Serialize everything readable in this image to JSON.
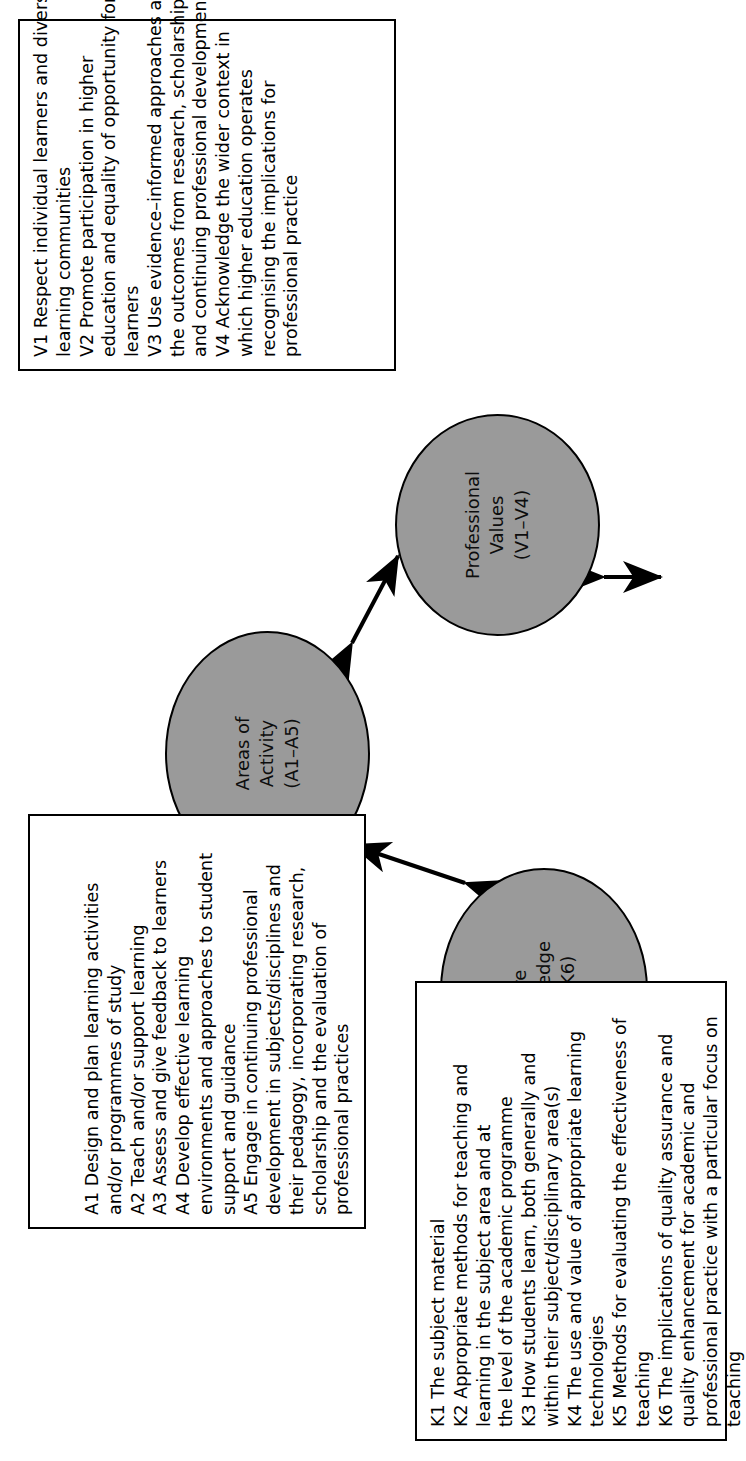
{
  "diagram": {
    "orientation": "rotated-90-ccw",
    "fill_color": "#9a9a9a",
    "stroke_color": "#000000",
    "background_color": "#ffffff"
  },
  "nodes": {
    "areas": {
      "label_lines": [
        "Areas of",
        "Activity",
        "(A1–A5)"
      ],
      "label_text": "Areas of Activity (A1–A5)"
    },
    "values": {
      "label_lines": [
        "Professional",
        "Values",
        "(V1–V4)"
      ],
      "label_text": "Professional Values (V1–V4)"
    },
    "knowledge": {
      "label_lines": [
        "Core",
        "Knowledge",
        "(K1–K6)"
      ],
      "label_text": "Core Knowledge (K1–K6)"
    }
  },
  "boxes": {
    "areas_of_activity": {
      "lines": [
        "A1 Design and plan learning activities",
        "and/or programmes of study",
        "A2 Teach and/or support learning",
        "A3 Assess and give feedback to learners",
        "A4 Develop effective learning",
        "environments and approaches to student",
        "support and guidance",
        "A5 Engage in continuing professional",
        "development in subjects/disciplines and",
        "their pedagogy, incorporating research,",
        "scholarship and the evaluation of",
        "professional practices"
      ]
    },
    "professional_values": {
      "lines": [
        "V1 Respect individual learners and diverse",
        "learning communities",
        "V2 Promote participation in higher",
        "education and equality of opportunity for",
        "learners",
        "V3 Use evidence–informed approaches and",
        "the outcomes from research, scholarship",
        "and continuing professional development",
        "V4 Acknowledge the wider context in",
        "which higher education operates",
        "recognising the implications for",
        "professional practice"
      ]
    },
    "core_knowledge": {
      "lines": [
        "K1 The subject material",
        "K2 Appropriate methods for teaching and",
        "learning in the subject area and at",
        "the level of the academic programme",
        "K3 How students learn, both generally and",
        "within their subject/disciplinary area(s)",
        "K4 The use and value of appropriate learning",
        "technologies",
        "K5 Methods for evaluating the effectiveness of",
        "teaching",
        "K6 The implications of quality assurance and",
        "quality enhancement for academic and",
        "professional practice with a particular focus on",
        "teaching"
      ]
    }
  },
  "connectors": [
    {
      "name": "areas-values",
      "from": "areas",
      "to": "values",
      "style": "double-headed-arrow"
    },
    {
      "name": "values-knowledge",
      "from": "values",
      "to": "knowledge",
      "style": "double-headed-arrow"
    },
    {
      "name": "knowledge-areas",
      "from": "knowledge",
      "to": "areas",
      "style": "double-headed-arrow"
    }
  ]
}
